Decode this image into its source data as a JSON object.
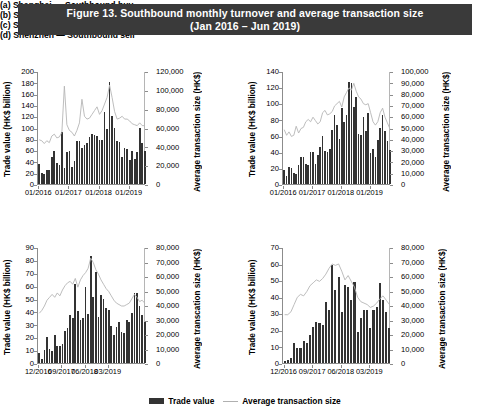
{
  "figure": {
    "title_line1": "Figure 13.  Southbound monthly turnover and average transaction size",
    "title_line2": "(Jan 2016 – Jun 2019)",
    "title_bg": "#3a3a3a",
    "bar_color": "#333333",
    "line_color": "#b5b5b5"
  },
  "legend": {
    "bar_label": "Trade value",
    "line_label": "Average transaction size"
  },
  "chart_data": [
    {
      "id": "a",
      "type": "bar",
      "title": "(a) Shanghai — Southbound buy",
      "ylabel": "Trade value (HK$ billion)",
      "y2label": "Average transaction size (HK$)",
      "xlabel": "",
      "ylim": [
        0,
        200
      ],
      "yticks": [
        0,
        20,
        40,
        60,
        80,
        100,
        120,
        140,
        160,
        180,
        200
      ],
      "ytick_labels": [
        "0",
        "20",
        "40",
        "60",
        "80",
        "100",
        "120",
        "140",
        "160",
        "180",
        "200"
      ],
      "y2lim": [
        0,
        120000
      ],
      "y2ticks": [
        0,
        20000,
        40000,
        60000,
        80000,
        100000,
        120000
      ],
      "y2tick_labels": [
        "0",
        "20,000",
        "40,000",
        "60,000",
        "80,000",
        "100,000",
        "120,000"
      ],
      "xtick_labels": [
        "01/2016",
        "01/2017",
        "01/2018",
        "01/2019"
      ],
      "xtick_idx": [
        0,
        12,
        24,
        36
      ],
      "n": 42,
      "grid": false,
      "legend_position": "bottom",
      "series": [
        {
          "name": "Trade value",
          "kind": "bar",
          "axis": "left",
          "values": [
            36,
            20,
            18,
            24,
            24,
            48,
            58,
            37,
            34,
            92,
            29,
            57,
            58,
            31,
            41,
            76,
            77,
            63,
            69,
            73,
            83,
            89,
            86,
            85,
            78,
            78,
            127,
            98,
            180,
            120,
            100,
            76,
            74,
            48,
            64,
            62,
            42,
            58,
            45,
            56,
            99,
            73,
            59
          ]
        },
        {
          "name": "Average transaction size",
          "kind": "line",
          "axis": "right",
          "values": [
            48000,
            47000,
            44000,
            47000,
            45000,
            52000,
            54000,
            50000,
            51000,
            56000,
            105000,
            64000,
            58000,
            56000,
            52000,
            58000,
            66000,
            91000,
            73000,
            70000,
            71000,
            75000,
            79000,
            83000,
            75000,
            79000,
            86000,
            93000,
            106000,
            93000,
            78000,
            70000,
            71000,
            73000,
            70000,
            70000,
            68000,
            65000,
            64000,
            63000,
            66000,
            63000,
            63000
          ]
        }
      ]
    },
    {
      "id": "b",
      "type": "bar",
      "title": "(b) Shanghai — Southbound sell",
      "ylabel": "Trade value (HK$ billion)",
      "y2label": "Average transaction size (HK$)",
      "xlabel": "",
      "ylim": [
        0,
        140
      ],
      "yticks": [
        0,
        20,
        40,
        60,
        80,
        100,
        120,
        140
      ],
      "ytick_labels": [
        "0",
        "20",
        "40",
        "60",
        "80",
        "100",
        "120",
        "140"
      ],
      "y2lim": [
        0,
        100000
      ],
      "y2ticks": [
        0,
        10000,
        20000,
        30000,
        40000,
        50000,
        60000,
        70000,
        80000,
        90000,
        100000
      ],
      "y2tick_labels": [
        "0",
        "10,000",
        "20,000",
        "30,000",
        "40,000",
        "50,000",
        "60,000",
        "70,000",
        "80,000",
        "90,000",
        "100,000"
      ],
      "xtick_labels": [
        "01/2016",
        "01/2017",
        "01/2018",
        "01/2019"
      ],
      "xtick_idx": [
        0,
        12,
        24,
        36
      ],
      "n": 42,
      "grid": false,
      "legend_position": "bottom",
      "series": [
        {
          "name": "Trade value",
          "kind": "bar",
          "axis": "left",
          "values": [
            17,
            10,
            21,
            20,
            14,
            13,
            23,
            34,
            33,
            25,
            24,
            40,
            40,
            25,
            36,
            46,
            60,
            41,
            40,
            44,
            67,
            86,
            73,
            56,
            94,
            77,
            85,
            127,
            125,
            96,
            108,
            62,
            61,
            83,
            66,
            88,
            38,
            44,
            34,
            54,
            70,
            85,
            66,
            53,
            42
          ]
        },
        {
          "name": "Average transaction size",
          "kind": "line",
          "axis": "right",
          "values": [
            49000,
            44000,
            47000,
            43000,
            44000,
            52000,
            46000,
            50000,
            51000,
            56000,
            58000,
            56000,
            60000,
            57000,
            54000,
            56000,
            64000,
            66000,
            62000,
            63000,
            65000,
            70000,
            72000,
            74000,
            69000,
            78000,
            82000,
            86000,
            84000,
            90000,
            83000,
            78000,
            76000,
            72000,
            71000,
            72000,
            64000,
            56000,
            53000,
            56000,
            64000,
            68000,
            60000,
            55000,
            50000
          ]
        }
      ]
    },
    {
      "id": "c",
      "type": "bar",
      "title": "(c) Shenzhen — Southbound buy",
      "ylabel": "Trade value (HK$ billion)",
      "y2label": "Average transcation size (HK$)",
      "xlabel": "",
      "ylim": [
        0,
        90
      ],
      "yticks": [
        0,
        10,
        20,
        30,
        40,
        50,
        60,
        70,
        80,
        90
      ],
      "ytick_labels": [
        "0",
        "10",
        "20",
        "30",
        "40",
        "50",
        "60",
        "70",
        "80",
        "90"
      ],
      "y2lim": [
        0,
        80000
      ],
      "y2ticks": [
        0,
        10000,
        20000,
        30000,
        40000,
        50000,
        60000,
        70000,
        80000
      ],
      "y2tick_labels": [
        "0",
        "10,000",
        "20,000",
        "30,000",
        "40,000",
        "50,000",
        "60,000",
        "70,000",
        "80,000"
      ],
      "xtick_labels": [
        "12/2016",
        "09/2017",
        "06/2018",
        "03/2019"
      ],
      "xtick_idx": [
        0,
        9,
        18,
        27
      ],
      "n": 31,
      "grid": false,
      "legend_position": "bottom",
      "series": [
        {
          "name": "Trade value",
          "kind": "bar",
          "axis": "left",
          "values": [
            8,
            3,
            10,
            20,
            11,
            9,
            22,
            13,
            13,
            15,
            25,
            27,
            37,
            35,
            61,
            40,
            33,
            35,
            59,
            38,
            83,
            51,
            71,
            36,
            53,
            50,
            43,
            41,
            29,
            22,
            28,
            32,
            24,
            23,
            33,
            32,
            39,
            54,
            54,
            44,
            37,
            32
          ]
        },
        {
          "name": "Average transaction size",
          "kind": "line",
          "axis": "right",
          "values": [
            35000,
            37000,
            40000,
            44000,
            46000,
            48000,
            46000,
            49000,
            47000,
            51000,
            54000,
            56000,
            57000,
            55000,
            59000,
            53000,
            58000,
            61000,
            63000,
            66000,
            73000,
            70000,
            65000,
            62000,
            58000,
            55000,
            52000,
            50000,
            47000,
            44000,
            42000,
            41000,
            40000,
            40000,
            41000,
            42000,
            45000,
            48000,
            46000,
            43000,
            44000,
            42000
          ]
        }
      ]
    },
    {
      "id": "d",
      "type": "bar",
      "title": "(d) Shenzhen — Southbound sell",
      "ylabel": "Trade value (HK$ billion)",
      "y2label": "Average transaction size (HK$)",
      "xlabel": "",
      "ylim": [
        0,
        70
      ],
      "yticks": [
        0,
        10,
        20,
        30,
        40,
        50,
        60,
        70
      ],
      "ytick_labels": [
        "0",
        "10",
        "20",
        "30",
        "40",
        "50",
        "60",
        "70"
      ],
      "y2lim": [
        0,
        80000
      ],
      "y2ticks": [
        0,
        10000,
        20000,
        30000,
        40000,
        50000,
        60000,
        70000,
        80000
      ],
      "y2tick_labels": [
        "0",
        "10,000",
        "20,000",
        "30,000",
        "40,000",
        "50,000",
        "60,000",
        "70,000",
        "80,000"
      ],
      "xtick_labels": [
        "12/2016",
        "09/2017",
        "06/2018",
        "03/2019"
      ],
      "xtick_idx": [
        0,
        9,
        18,
        27
      ],
      "n": 31,
      "grid": false,
      "legend_position": "bottom",
      "series": [
        {
          "name": "Trade value",
          "kind": "bar",
          "axis": "left",
          "values": [
            1,
            2,
            3,
            12,
            9,
            9,
            13,
            12,
            17,
            22,
            25,
            24,
            23,
            37,
            32,
            59,
            44,
            52,
            31,
            47,
            46,
            38,
            49,
            19,
            27,
            32,
            32,
            21,
            32,
            34,
            48,
            38,
            31,
            21
          ]
        },
        {
          "name": "Average transaction size",
          "kind": "line",
          "axis": "right",
          "values": [
            34000,
            34000,
            36000,
            41000,
            46000,
            48000,
            47000,
            50000,
            54000,
            56000,
            58000,
            57000,
            59000,
            62000,
            66000,
            69000,
            68000,
            69000,
            64000,
            58000,
            61000,
            57000,
            53000,
            46000,
            43000,
            42000,
            41000,
            39000,
            40000,
            42000,
            45000,
            47000,
            44000,
            41000
          ]
        }
      ]
    }
  ]
}
